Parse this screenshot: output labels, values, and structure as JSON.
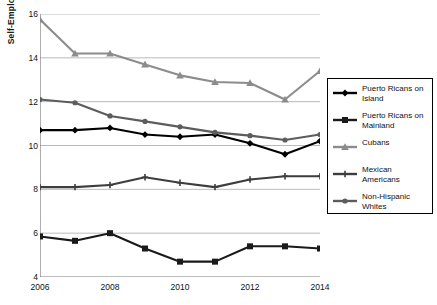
{
  "chart_data": {
    "type": "line",
    "title": "",
    "xlabel": "",
    "ylabel": "Self-Employment Rate (%)",
    "x": [
      2006,
      2007,
      2008,
      2009,
      2010,
      2011,
      2012,
      2013,
      2014
    ],
    "xtick_labels": [
      "2006",
      "2008",
      "2010",
      "2012",
      "2014"
    ],
    "xtick_values": [
      2006,
      2008,
      2010,
      2012,
      2014
    ],
    "ytick_labels": [
      "4",
      "6",
      "8",
      "10",
      "12",
      "14",
      "16"
    ],
    "ytick_values": [
      4,
      6,
      8,
      10,
      12,
      14,
      16
    ],
    "xlim": [
      2006,
      2014
    ],
    "ylim": [
      4,
      16
    ],
    "grid": "horizontal-major",
    "legend_position": "right-outside",
    "series": [
      {
        "name": "Puerto Ricans on Island",
        "marker": "diamond",
        "color": "#000000",
        "values": [
          10.7,
          10.7,
          10.8,
          10.5,
          10.4,
          10.5,
          10.1,
          9.6,
          10.2
        ]
      },
      {
        "name": "Puerto Ricans on Mainland",
        "marker": "square",
        "color": "#1a1a1a",
        "values": [
          5.85,
          5.65,
          6.0,
          5.3,
          4.7,
          4.7,
          5.4,
          5.4,
          5.3
        ]
      },
      {
        "name": "Cubans",
        "marker": "triangle",
        "color": "#8c8c8c",
        "values": [
          15.75,
          14.2,
          14.2,
          13.7,
          13.2,
          12.9,
          12.85,
          12.1,
          13.4
        ]
      },
      {
        "name": "Mexican Americans",
        "marker": "cross",
        "color": "#3d3d3d",
        "values": [
          8.1,
          8.1,
          8.2,
          8.55,
          8.3,
          8.1,
          8.45,
          8.6,
          8.6
        ]
      },
      {
        "name": "Non-Hispanic Whites",
        "marker": "circle",
        "color": "#5c5c5c",
        "values": [
          12.1,
          11.95,
          11.35,
          11.1,
          10.85,
          10.6,
          10.45,
          10.25,
          10.5
        ]
      }
    ]
  },
  "legend": {
    "entries": [
      {
        "label": "Puerto Ricans on Island"
      },
      {
        "label": "Puerto Ricans on Mainland"
      },
      {
        "label": "Cubans"
      },
      {
        "label": "Mexican Americans"
      },
      {
        "label": "Non-Hispanic Whites"
      }
    ]
  }
}
